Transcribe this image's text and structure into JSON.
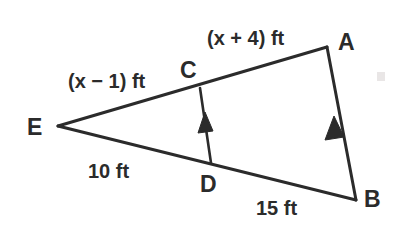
{
  "diagram": {
    "kind": "similar-triangles-geometry",
    "background_color": "#ffffff",
    "line_color": "#2b2b2b",
    "vertices": [
      {
        "id": "E",
        "label": "E",
        "x": 58,
        "y": 126,
        "label_x": 27,
        "label_y": 135
      },
      {
        "id": "A",
        "label": "A",
        "x": 327,
        "y": 47,
        "label_x": 338,
        "label_y": 50
      },
      {
        "id": "B",
        "label": "B",
        "x": 356,
        "y": 200,
        "label_x": 364,
        "label_y": 207
      },
      {
        "id": "C",
        "label": "C",
        "x": 200,
        "y": 88,
        "label_x": 180,
        "label_y": 78
      },
      {
        "id": "D",
        "label": "D",
        "x": 211,
        "y": 163,
        "label_x": 200,
        "label_y": 192
      }
    ],
    "segments": [
      {
        "id": "EA",
        "from": "E",
        "to": "A",
        "kind": "solid"
      },
      {
        "id": "EB",
        "from": "E",
        "to": "B",
        "kind": "solid"
      },
      {
        "id": "CD",
        "from": "C",
        "to": "D",
        "kind": "solid-with-arrow"
      },
      {
        "id": "AB",
        "from": "A",
        "to": "B",
        "kind": "solid-with-arrow"
      }
    ],
    "parallel_marks": {
      "count": 1,
      "style": "single-arrowhead",
      "direction": "upward",
      "on_segments": [
        "CD",
        "AB"
      ]
    },
    "measures": [
      {
        "id": "EC",
        "text": "(x − 1) ft",
        "x": 68,
        "y": 88
      },
      {
        "id": "CA",
        "text": "(x + 4) ft",
        "x": 207,
        "y": 45
      },
      {
        "id": "ED",
        "text": "10 ft",
        "x": 88,
        "y": 178
      },
      {
        "id": "DB",
        "text": "15 ft",
        "x": 256,
        "y": 215
      }
    ]
  }
}
